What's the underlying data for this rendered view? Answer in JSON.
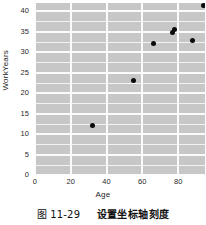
{
  "chart_data": {
    "type": "scatter",
    "title": "",
    "xlabel": "Age",
    "ylabel": "WorkYears",
    "xlim": [
      0,
      95
    ],
    "ylim": [
      0,
      42
    ],
    "xticks": [
      "0",
      "20",
      "40",
      "60",
      "80"
    ],
    "xtick_values": [
      0,
      20,
      40,
      60,
      80
    ],
    "yticks": [
      "0",
      "5",
      "10",
      "15",
      "20",
      "25",
      "30",
      "35",
      "40"
    ],
    "ytick_values": [
      0,
      5,
      10,
      15,
      20,
      25,
      30,
      35,
      40
    ],
    "grid": true,
    "legend": "none",
    "background_color": "#c7c7c7",
    "gridline_color": "#fbfbfb",
    "marker_color": "#0a0a0a",
    "series": [
      {
        "name": "employees",
        "points": [
          {
            "x": 32,
            "y": 12
          },
          {
            "x": 55,
            "y": 23
          },
          {
            "x": 66,
            "y": 32
          },
          {
            "x": 77,
            "y": 34.7
          },
          {
            "x": 78,
            "y": 35.6
          },
          {
            "x": 88,
            "y": 32.8
          },
          {
            "x": 94,
            "y": 41.5
          }
        ]
      }
    ]
  },
  "caption": {
    "number": "图 11-29",
    "text": "设置坐标轴刻度"
  }
}
